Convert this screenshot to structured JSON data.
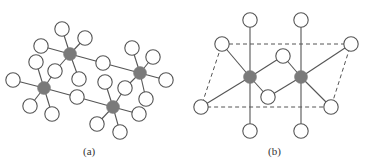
{
  "figure": {
    "panels": [
      {
        "label": "(a)",
        "center_atoms": [
          {
            "x": 70,
            "y": 54
          },
          {
            "x": 44,
            "y": 88
          },
          {
            "x": 140,
            "y": 73
          },
          {
            "x": 113,
            "y": 107
          }
        ],
        "ligands": [
          {
            "x": 62,
            "y": 29,
            "atom": 0
          },
          {
            "x": 85,
            "y": 38,
            "atom": 0
          },
          {
            "x": 41,
            "y": 46,
            "atom": 0
          },
          {
            "x": 55,
            "y": 71,
            "atom": 0
          },
          {
            "x": 79,
            "y": 79,
            "atom": 0
          },
          {
            "x": 103,
            "y": 63,
            "atom": 0
          },
          {
            "x": 36,
            "y": 62,
            "atom": 1
          },
          {
            "x": 13,
            "y": 80,
            "atom": 1
          },
          {
            "x": 30,
            "y": 106,
            "atom": 1
          },
          {
            "x": 52,
            "y": 114,
            "atom": 1
          },
          {
            "x": 55,
            "y": 71,
            "atom": 1
          },
          {
            "x": 77,
            "y": 97,
            "atom": 1
          },
          {
            "x": 132,
            "y": 48,
            "atom": 2
          },
          {
            "x": 153,
            "y": 57,
            "atom": 2
          },
          {
            "x": 166,
            "y": 80,
            "atom": 2
          },
          {
            "x": 146,
            "y": 99,
            "atom": 2
          },
          {
            "x": 125,
            "y": 88,
            "atom": 2
          },
          {
            "x": 103,
            "y": 63,
            "atom": 2
          },
          {
            "x": 105,
            "y": 82,
            "atom": 3
          },
          {
            "x": 125,
            "y": 88,
            "atom": 3
          },
          {
            "x": 139,
            "y": 114,
            "atom": 3
          },
          {
            "x": 120,
            "y": 132,
            "atom": 3
          },
          {
            "x": 97,
            "y": 124,
            "atom": 3
          },
          {
            "x": 77,
            "y": 97,
            "atom": 3
          }
        ]
      },
      {
        "label": "(b)",
        "center_atoms": [
          {
            "x": 250,
            "y": 77
          },
          {
            "x": 301,
            "y": 77
          }
        ],
        "ligands": [
          {
            "x": 250,
            "y": 20,
            "atom": 0
          },
          {
            "x": 250,
            "y": 131,
            "atom": 0
          },
          {
            "x": 222,
            "y": 44,
            "atom": 0
          },
          {
            "x": 201,
            "y": 107,
            "atom": 0
          },
          {
            "x": 283,
            "y": 56,
            "atom": 0
          },
          {
            "x": 268,
            "y": 97,
            "atom": 0
          },
          {
            "x": 301,
            "y": 20,
            "atom": 1
          },
          {
            "x": 301,
            "y": 131,
            "atom": 1
          },
          {
            "x": 351,
            "y": 44,
            "atom": 1
          },
          {
            "x": 331,
            "y": 107,
            "atom": 1
          },
          {
            "x": 283,
            "y": 56,
            "atom": 1
          },
          {
            "x": 268,
            "y": 97,
            "atom": 1
          }
        ],
        "unit_cell": [
          {
            "x": 222,
            "y": 44
          },
          {
            "x": 351,
            "y": 44
          },
          {
            "x": 331,
            "y": 107
          },
          {
            "x": 201,
            "y": 107
          }
        ]
      }
    ],
    "colors": {
      "center_atom": "#7a7a7a",
      "ligand_fill": "#ffffff",
      "stroke": "#555555",
      "bond": "#555555"
    }
  },
  "captions": {
    "a": "(a)",
    "b": "(b)"
  }
}
